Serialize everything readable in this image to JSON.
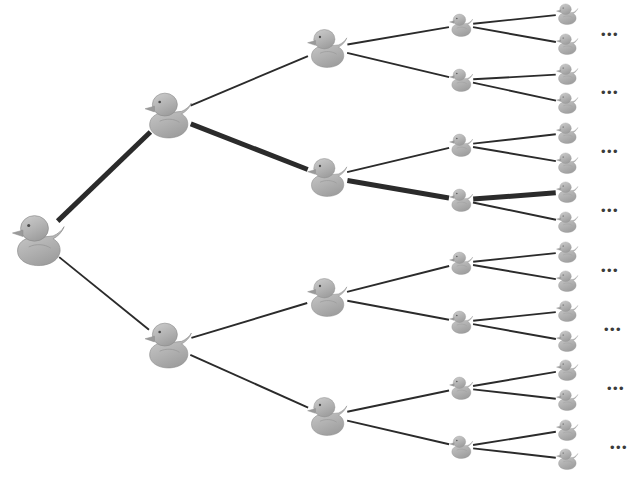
{
  "figure": {
    "background_color": "#ffffff",
    "width": 641,
    "height": 485
  },
  "style": {
    "edge_color": "#2b2b2b",
    "edge_width_normal": 1.9,
    "edge_width_highlight": 5.0,
    "duck_body_fill": "#b0b0b0",
    "duck_body_fill_light": "#c9c9c9",
    "duck_body_stroke": "#8c8c8c",
    "duck_shadow_fill": "#9a9a9a",
    "duck_eye_color": "#4a4a4a",
    "ellipsis_color": "#3b3b3b"
  },
  "tree": {
    "levels": 5,
    "branching_factor": 2,
    "highlighted_path": [
      "root",
      "L1-0",
      "L2-1",
      "L3-3",
      "L4-6"
    ],
    "nodes": [
      {
        "id": "root",
        "label": "duck-root",
        "level": 0,
        "x": 38,
        "y": 240,
        "size": 58
      },
      {
        "id": "L1-0",
        "label": "duck-L1-0",
        "level": 1,
        "x": 168,
        "y": 115,
        "size": 52
      },
      {
        "id": "L1-1",
        "label": "duck-L1-1",
        "level": 1,
        "x": 168,
        "y": 345,
        "size": 52
      },
      {
        "id": "L2-0",
        "label": "duck-L2-0",
        "level": 2,
        "x": 327,
        "y": 48,
        "size": 44
      },
      {
        "id": "L2-1",
        "label": "duck-L2-1",
        "level": 2,
        "x": 327,
        "y": 177,
        "size": 44
      },
      {
        "id": "L2-2",
        "label": "duck-L2-2",
        "level": 2,
        "x": 327,
        "y": 297,
        "size": 44
      },
      {
        "id": "L2-3",
        "label": "duck-L2-3",
        "level": 2,
        "x": 327,
        "y": 416,
        "size": 44
      },
      {
        "id": "L3-0",
        "label": "duck-L3-0",
        "level": 3,
        "x": 461,
        "y": 25,
        "size": 26
      },
      {
        "id": "L3-1",
        "label": "duck-L3-1",
        "level": 3,
        "x": 461,
        "y": 80,
        "size": 26
      },
      {
        "id": "L3-2",
        "label": "duck-L3-2",
        "level": 3,
        "x": 461,
        "y": 145,
        "size": 26
      },
      {
        "id": "L3-3",
        "label": "duck-L3-3",
        "level": 3,
        "x": 461,
        "y": 200,
        "size": 26
      },
      {
        "id": "L3-4",
        "label": "duck-L3-4",
        "level": 3,
        "x": 461,
        "y": 263,
        "size": 26
      },
      {
        "id": "L3-5",
        "label": "duck-L3-5",
        "level": 3,
        "x": 461,
        "y": 322,
        "size": 26
      },
      {
        "id": "L3-6",
        "label": "duck-L3-6",
        "level": 3,
        "x": 461,
        "y": 388,
        "size": 26
      },
      {
        "id": "L3-7",
        "label": "duck-L3-7",
        "level": 3,
        "x": 461,
        "y": 447,
        "size": 26
      },
      {
        "id": "L4-0",
        "label": "duck-L4-0",
        "level": 4,
        "x": 567,
        "y": 14,
        "size": 24
      },
      {
        "id": "L4-1",
        "label": "duck-L4-1",
        "level": 4,
        "x": 567,
        "y": 44,
        "size": 24
      },
      {
        "id": "L4-2",
        "label": "duck-L4-2",
        "level": 4,
        "x": 567,
        "y": 74,
        "size": 24
      },
      {
        "id": "L4-3",
        "label": "duck-L4-3",
        "level": 4,
        "x": 567,
        "y": 103,
        "size": 24
      },
      {
        "id": "L4-4",
        "label": "duck-L4-4",
        "level": 4,
        "x": 567,
        "y": 133,
        "size": 24
      },
      {
        "id": "L4-5",
        "label": "duck-L4-5",
        "level": 4,
        "x": 567,
        "y": 163,
        "size": 24
      },
      {
        "id": "L4-6",
        "label": "duck-L4-6",
        "level": 4,
        "x": 567,
        "y": 192,
        "size": 24
      },
      {
        "id": "L4-7",
        "label": "duck-L4-7",
        "level": 4,
        "x": 567,
        "y": 222,
        "size": 24
      },
      {
        "id": "L4-8",
        "label": "duck-L4-8",
        "level": 4,
        "x": 567,
        "y": 252,
        "size": 24
      },
      {
        "id": "L4-9",
        "label": "duck-L4-9",
        "level": 4,
        "x": 567,
        "y": 281,
        "size": 24
      },
      {
        "id": "L4-10",
        "label": "duck-L4-10",
        "level": 4,
        "x": 567,
        "y": 311,
        "size": 24
      },
      {
        "id": "L4-11",
        "label": "duck-L4-11",
        "level": 4,
        "x": 567,
        "y": 341,
        "size": 24
      },
      {
        "id": "L4-12",
        "label": "duck-L4-12",
        "level": 4,
        "x": 567,
        "y": 370,
        "size": 24
      },
      {
        "id": "L4-13",
        "label": "duck-L4-13",
        "level": 4,
        "x": 567,
        "y": 400,
        "size": 24
      },
      {
        "id": "L4-14",
        "label": "duck-L4-14",
        "level": 4,
        "x": 567,
        "y": 430,
        "size": 24
      },
      {
        "id": "L4-15",
        "label": "duck-L4-15",
        "level": 4,
        "x": 567,
        "y": 459,
        "size": 24
      }
    ],
    "edges": [
      {
        "from": "root",
        "to": "L1-0",
        "highlighted": true
      },
      {
        "from": "root",
        "to": "L1-1",
        "highlighted": false
      },
      {
        "from": "L1-0",
        "to": "L2-0",
        "highlighted": false
      },
      {
        "from": "L1-0",
        "to": "L2-1",
        "highlighted": true
      },
      {
        "from": "L1-1",
        "to": "L2-2",
        "highlighted": false
      },
      {
        "from": "L1-1",
        "to": "L2-3",
        "highlighted": false
      },
      {
        "from": "L2-0",
        "to": "L3-0",
        "highlighted": false
      },
      {
        "from": "L2-0",
        "to": "L3-1",
        "highlighted": false
      },
      {
        "from": "L2-1",
        "to": "L3-2",
        "highlighted": false
      },
      {
        "from": "L2-1",
        "to": "L3-3",
        "highlighted": true
      },
      {
        "from": "L2-2",
        "to": "L3-4",
        "highlighted": false
      },
      {
        "from": "L2-2",
        "to": "L3-5",
        "highlighted": false
      },
      {
        "from": "L2-3",
        "to": "L3-6",
        "highlighted": false
      },
      {
        "from": "L2-3",
        "to": "L3-7",
        "highlighted": false
      },
      {
        "from": "L3-0",
        "to": "L4-0",
        "highlighted": false
      },
      {
        "from": "L3-0",
        "to": "L4-1",
        "highlighted": false
      },
      {
        "from": "L3-1",
        "to": "L4-2",
        "highlighted": false
      },
      {
        "from": "L3-1",
        "to": "L4-3",
        "highlighted": false
      },
      {
        "from": "L3-2",
        "to": "L4-4",
        "highlighted": false
      },
      {
        "from": "L3-2",
        "to": "L4-5",
        "highlighted": false
      },
      {
        "from": "L3-3",
        "to": "L4-6",
        "highlighted": true
      },
      {
        "from": "L3-3",
        "to": "L4-7",
        "highlighted": false
      },
      {
        "from": "L3-4",
        "to": "L4-8",
        "highlighted": false
      },
      {
        "from": "L3-4",
        "to": "L4-9",
        "highlighted": false
      },
      {
        "from": "L3-5",
        "to": "L4-10",
        "highlighted": false
      },
      {
        "from": "L3-5",
        "to": "L4-11",
        "highlighted": false
      },
      {
        "from": "L3-6",
        "to": "L4-12",
        "highlighted": false
      },
      {
        "from": "L3-6",
        "to": "L4-13",
        "highlighted": false
      },
      {
        "from": "L3-7",
        "to": "L4-14",
        "highlighted": false
      },
      {
        "from": "L3-7",
        "to": "L4-15",
        "highlighted": false
      }
    ]
  },
  "continuation_marks": [
    {
      "id": "ellipsis-0",
      "text": "•••",
      "x": 610,
      "y": 34
    },
    {
      "id": "ellipsis-1",
      "text": "•••",
      "x": 610,
      "y": 92
    },
    {
      "id": "ellipsis-2",
      "text": "•••",
      "x": 610,
      "y": 151
    },
    {
      "id": "ellipsis-3",
      "text": "•••",
      "x": 610,
      "y": 210
    },
    {
      "id": "ellipsis-4",
      "text": "•••",
      "x": 610,
      "y": 270
    },
    {
      "id": "ellipsis-5",
      "text": "•••",
      "x": 613,
      "y": 329
    },
    {
      "id": "ellipsis-6",
      "text": "•••",
      "x": 616,
      "y": 388
    },
    {
      "id": "ellipsis-7",
      "text": "•••",
      "x": 619,
      "y": 447
    }
  ]
}
